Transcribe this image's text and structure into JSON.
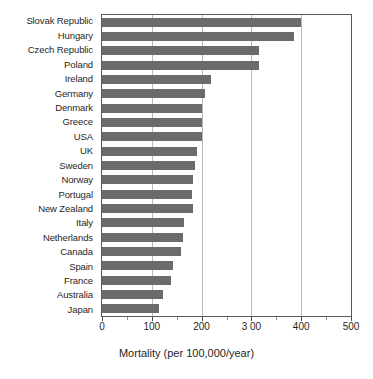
{
  "chart_data": {
    "type": "bar",
    "orientation": "horizontal",
    "title": "",
    "xlabel": "Mortality (per 100,000/year)",
    "ylabel": "",
    "xlim": [
      0,
      500
    ],
    "xticks": [
      0,
      100,
      200,
      300,
      400,
      500
    ],
    "xtick_labels": [
      "0",
      "100",
      "200",
      "3 00",
      "400",
      "500"
    ],
    "grid": "vertical",
    "legend": "none",
    "bar_color": "#6b6b6b",
    "categories": [
      "Slovak Republic",
      "Hungary",
      "Czech Republic",
      "Poland",
      "Ireland",
      "Germany",
      "Denmark",
      "Greece",
      "USA",
      "UK",
      "Sweden",
      "Norway",
      "Portugal",
      "New Zealand",
      "Italy",
      "Netherlands",
      "Canada",
      "Spain",
      "France",
      "Australia",
      "Japan"
    ],
    "values": [
      400,
      385,
      315,
      315,
      218,
      206,
      201,
      200,
      200,
      190,
      186,
      182,
      180,
      182,
      164,
      162,
      158,
      142,
      138,
      122,
      114
    ]
  }
}
